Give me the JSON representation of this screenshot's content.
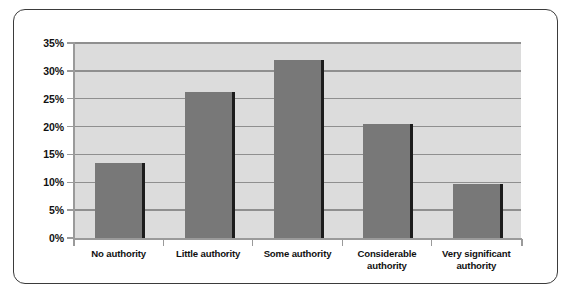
{
  "chart_data": {
    "type": "bar",
    "title": "",
    "subtitle": "",
    "xlabel": "",
    "ylabel": "",
    "categories": [
      "No authority",
      "Little authority",
      "Some authority",
      "Considerable authority",
      "Very significant authority"
    ],
    "category_lines": [
      [
        "No authority"
      ],
      [
        "Little authority"
      ],
      [
        "Some authority"
      ],
      [
        "Considerable",
        "authority"
      ],
      [
        "Very significant",
        "authority"
      ]
    ],
    "values": [
      13.4,
      26.2,
      32.0,
      20.4,
      9.7
    ],
    "ylim": [
      0,
      35
    ],
    "ytick_values": [
      0,
      5,
      10,
      15,
      20,
      25,
      30,
      35
    ],
    "ytick_labels": [
      "0%",
      "5%",
      "10%",
      "15%",
      "20%",
      "25%",
      "30%",
      "35%"
    ],
    "grid": true,
    "legend": false,
    "legend_position": "none",
    "colors": {
      "bar_fill": "#787878",
      "bar_shadow": "#1c1c1c",
      "plot_background": "#dcdcdc",
      "gridline": "#8f8f8f",
      "axis": "#9a9a9a",
      "frame_border": "#3b3b3b",
      "text": "#111111",
      "page_background": "#ffffff"
    }
  }
}
